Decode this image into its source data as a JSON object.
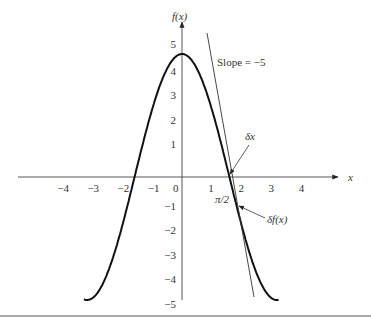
{
  "chart_data": {
    "type": "line",
    "title": "",
    "xlabel": "x",
    "ylabel": "f(x)",
    "function": "f(x) = 5cos(x)",
    "xlim": [
      -4.5,
      5
    ],
    "ylim": [
      -5,
      5
    ],
    "x_ticks": [
      "-4",
      "-3",
      "-2",
      "-1",
      "0",
      "1",
      "2",
      "3",
      "4"
    ],
    "y_ticks": [
      "5",
      "4",
      "3",
      "2",
      "1",
      "-1",
      "-2",
      "-3",
      "-4",
      "-5"
    ],
    "series": [
      {
        "name": "f(x)",
        "x": [
          -3.14,
          -2.5,
          -2,
          -1.57,
          -1,
          -0.5,
          0,
          0.5,
          1,
          1.57,
          2,
          2.5,
          3.14
        ],
        "values": [
          -5,
          -4.01,
          -2.08,
          0,
          2.7,
          4.39,
          5,
          4.39,
          2.7,
          0,
          -2.08,
          -4.01,
          -5
        ]
      },
      {
        "name": "tangent",
        "slope": -5,
        "through": [
          1.5708,
          0
        ]
      }
    ],
    "annotations": [
      "Slope = −5",
      "δx",
      "π/2",
      "δf(x)"
    ],
    "grid": false,
    "legend": "none"
  },
  "labels": {
    "ylabel": "f(x)",
    "xlabel": "x",
    "slope": "Slope = −5",
    "dx": "δx",
    "pi2": "π/2",
    "df": "δf(x)"
  }
}
